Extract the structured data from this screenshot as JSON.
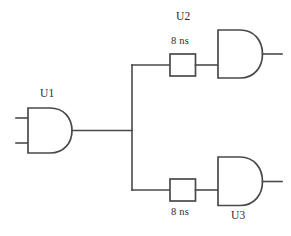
{
  "diagram": {
    "background_color": "#ffffff",
    "line_color": "#4a4a4a",
    "text_color": "#2b2b2b"
  },
  "gates": [
    {
      "ref": "U1",
      "kind": "and-gate",
      "label": "U1",
      "label_position": "above",
      "inputs": 2,
      "outputs": 1
    },
    {
      "ref": "U2",
      "kind": "and-gate",
      "label": "U2",
      "label_position": "above",
      "inputs": 1,
      "outputs": 1
    },
    {
      "ref": "U3",
      "kind": "and-gate",
      "label": "U3",
      "label_position": "below",
      "inputs": 1,
      "outputs": 1
    }
  ],
  "delay_elements": [
    {
      "id": "delay-upper",
      "label": "8 ns",
      "label_position": "above",
      "value": 8,
      "unit": "ns",
      "feeds": "U2"
    },
    {
      "id": "delay-lower",
      "label": "8 ns",
      "label_position": "below",
      "value": 8,
      "unit": "ns",
      "feeds": "U3"
    }
  ],
  "nets": [
    {
      "id": "u1-in-a",
      "from": "input-a",
      "to": "U1.in1"
    },
    {
      "id": "u1-in-b",
      "from": "input-b",
      "to": "U1.in2"
    },
    {
      "id": "u1-out-trunk",
      "from": "U1.out",
      "to": "fanout-junction"
    },
    {
      "id": "fanout-vertical",
      "from": "fanout-junction",
      "to": "branch-taps"
    },
    {
      "id": "branch-upper",
      "from": "fanout-junction",
      "to": "delay-upper"
    },
    {
      "id": "branch-lower",
      "from": "fanout-junction",
      "to": "delay-lower"
    },
    {
      "id": "delay-upper-to-u2",
      "from": "delay-upper",
      "to": "U2.in1"
    },
    {
      "id": "delay-lower-to-u3",
      "from": "delay-lower",
      "to": "U3.in1"
    },
    {
      "id": "u2-out",
      "from": "U2.out",
      "to": "output-1"
    },
    {
      "id": "u3-out",
      "from": "U3.out",
      "to": "output-2"
    }
  ]
}
